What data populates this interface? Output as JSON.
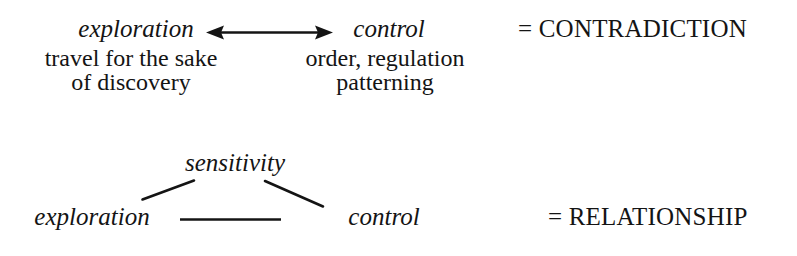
{
  "diagram": {
    "background_color": "#ffffff",
    "ink_color": "#141414",
    "top_pair": {
      "left_term": "exploration",
      "left_description_line1": "travel for the sake",
      "left_description_line2": "of discovery",
      "right_term": "control",
      "right_description_line1": "order, regulation",
      "right_description_line2": "patterning",
      "connector": "double-headed-arrow",
      "result_label": "= CONTRADICTION"
    },
    "bottom_triad": {
      "apex_term": "sensitivity",
      "left_term": "exploration",
      "right_term": "control",
      "connector_left": "line-apex-to-left",
      "connector_right": "line-apex-to-right",
      "connector_base": "horizontal-line",
      "result_label": "= RELATIONSHIP"
    }
  }
}
